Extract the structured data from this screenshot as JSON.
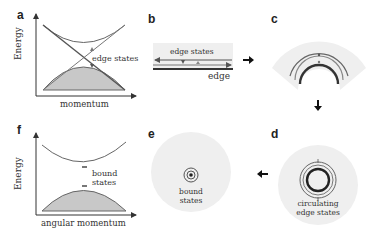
{
  "panels": {
    "a": {
      "label": "a",
      "ylabel": "Energy",
      "xlabel": "momentum",
      "annotation": "edge states"
    },
    "b": {
      "label": "b",
      "annotation": "edge states",
      "edge_label": "edge"
    },
    "c": {
      "label": "c"
    },
    "d": {
      "label": "d",
      "annotation_line1": "circulating",
      "annotation_line2": "edge states"
    },
    "e": {
      "label": "e",
      "annotation_line1": "bound",
      "annotation_line2": "states"
    },
    "f": {
      "label": "f",
      "ylabel": "Energy",
      "xlabel": "angular momentum",
      "annotation_line1": "bound",
      "annotation_line2": "states"
    }
  },
  "flow": [
    "a",
    "b",
    "c",
    "d",
    "e",
    "f"
  ],
  "colors": {
    "line": "#555555",
    "fill_gray": "#c8c8c8",
    "bg_disk": "#efefef",
    "dark": "#222222"
  }
}
